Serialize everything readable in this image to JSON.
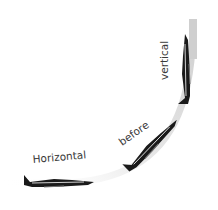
{
  "diagram": {
    "labels": {
      "horizontal": "Horizontal",
      "before": "before",
      "vertical": "vertical"
    },
    "stages": [
      {
        "name": "horizontal",
        "angle_deg": 0
      },
      {
        "name": "climbing",
        "angle_deg": -45
      },
      {
        "name": "vertical",
        "angle_deg": -90
      }
    ],
    "colors": {
      "track": "#d4d4d4",
      "aircraft": "#1a1a1a",
      "text": "#3a3a3a"
    }
  }
}
